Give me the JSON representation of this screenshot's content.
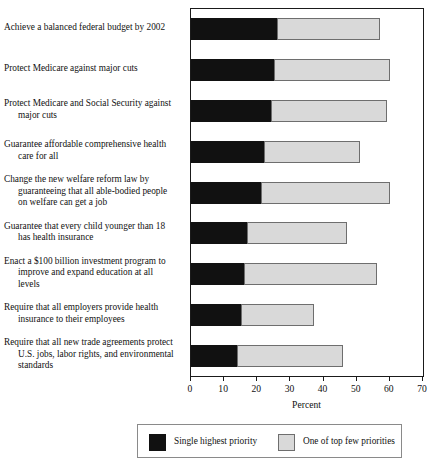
{
  "chart_data": {
    "type": "bar",
    "orientation": "horizontal",
    "stacked": true,
    "title": "",
    "xlabel": "Percent",
    "ylabel": "",
    "xlim": [
      0,
      70
    ],
    "xticks": [
      0,
      10,
      20,
      30,
      40,
      50,
      60,
      70
    ],
    "grid": false,
    "legend_position": "bottom",
    "categories": [
      "Achieve a balanced federal budget by 2002",
      "Protect Medicare against major cuts",
      "Protect Medicare and Social Security against major cuts",
      "Guarantee affordable comprehensive health care for all",
      "Change the new welfare reform law by guaranteeing that all able-bodied people on welfare can get a job",
      "Guarantee that every child younger than 18 has health insurance",
      "Enact a $100 billion investment program to improve and expand education at all levels",
      "Require that all employers provide health insurance to their employees",
      "Require that all new trade agreements protect U.S. jobs, labor rights, and environmental standards"
    ],
    "series": [
      {
        "name": "Single highest priority",
        "color": "#111111",
        "values": [
          26,
          25,
          24,
          22,
          21,
          17,
          16,
          15,
          14
        ]
      },
      {
        "name": "One of top few priorities",
        "color": "#d9d9d9",
        "values": [
          31,
          35,
          35,
          29,
          39,
          30,
          40,
          22,
          32
        ]
      }
    ],
    "totals": [
      57,
      60,
      59,
      51,
      60,
      47,
      56,
      37,
      46
    ]
  },
  "axis": {
    "title": "Percent",
    "tick_labels": [
      "0",
      "10",
      "20",
      "30",
      "40",
      "50",
      "60",
      "70"
    ]
  },
  "legend": {
    "entries": [
      {
        "label": "Single highest priority",
        "swatch": "dark-swatch-icon"
      },
      {
        "label": "One of top few priorities",
        "swatch": "light-swatch-icon"
      }
    ]
  }
}
